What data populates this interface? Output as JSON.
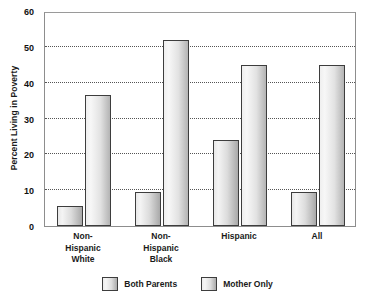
{
  "chart_data": {
    "type": "bar",
    "title": "",
    "xlabel": "",
    "ylabel": "Percent Living in Poverty",
    "ylim": [
      0,
      60
    ],
    "yticks": [
      0,
      10,
      20,
      30,
      40,
      50,
      60
    ],
    "grid": true,
    "legend_position": "bottom-center",
    "categories": [
      "Non-\nHispanic\nWhite",
      "Non-\nHispanic\nBlack",
      "Hispanic",
      "All"
    ],
    "category_lines": [
      [
        "Non-",
        "Hispanic",
        "White"
      ],
      [
        "Non-",
        "Hispanic",
        "Black"
      ],
      [
        "Hispanic"
      ],
      [
        "All"
      ]
    ],
    "series": [
      {
        "name": "Both Parents",
        "values": [
          5.5,
          9.5,
          24,
          9.5
        ],
        "color": "#d8d8d8"
      },
      {
        "name": "Mother Only",
        "values": [
          36.5,
          52,
          45,
          45
        ],
        "color": "#d8d8d8"
      }
    ]
  },
  "yaxis": {
    "title": "Percent Living in Poverty",
    "ticks": [
      "60",
      "50",
      "40",
      "30",
      "20",
      "10",
      "0"
    ]
  },
  "legend": {
    "items": [
      {
        "label": "Both Parents"
      },
      {
        "label": "Mother Only"
      }
    ]
  }
}
